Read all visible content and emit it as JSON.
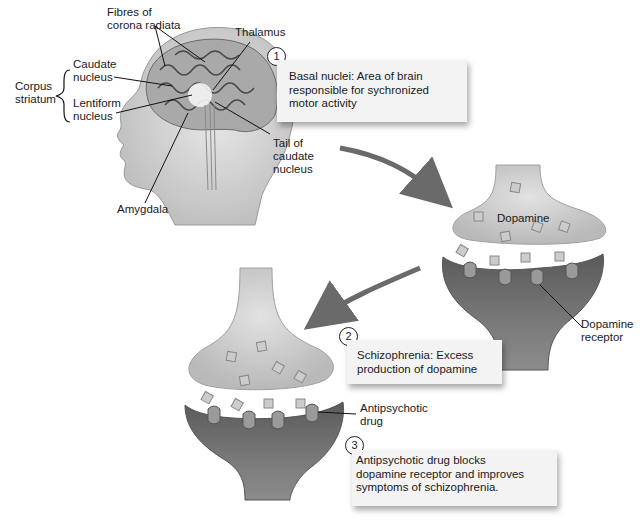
{
  "brain": {
    "labels": {
      "fibres_line1": "Fibres of",
      "fibres_line2": "corona radiata",
      "thalamus": "Thalamus",
      "caudate_line1": "Caudate",
      "caudate_line2": "nucleus",
      "corpus_line1": "Corpus",
      "corpus_line2": "striatum",
      "lentiform_line1": "Lentiform",
      "lentiform_line2": "nucleus",
      "tail_line1": "Tail of",
      "tail_line2": "caudate",
      "tail_line3": "nucleus",
      "amygdala": "Amygdala"
    }
  },
  "steps": [
    {
      "number": "1",
      "lines": [
        "Basal nuclei:  Area of brain",
        "responsible for sychronized",
        "motor activity"
      ]
    },
    {
      "number": "2",
      "lines": [
        "Schizophrenia:  Excess",
        "production of dopamine"
      ]
    },
    {
      "number": "3",
      "lines": [
        "Antipsychotic drug blocks",
        "dopamine receptor and improves",
        "symptoms of schizophrenia."
      ]
    }
  ],
  "synapse_top": {
    "dopamine_label": "Dopamine",
    "receptor_line1": "Dopamine",
    "receptor_line2": "receptor"
  },
  "synapse_bottom": {
    "drug_line1": "Antipsychotic",
    "drug_line2": "drug"
  },
  "colors": {
    "presynaptic": "#cfcfcf",
    "postsynaptic": "#6e6e6e",
    "arrow": "#6a6a6a",
    "box_bg": "#f3f3f3"
  }
}
